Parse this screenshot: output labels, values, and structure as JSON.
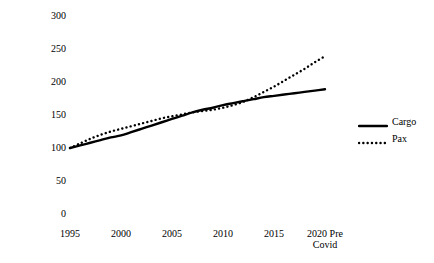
{
  "chart_data": {
    "type": "line",
    "title": "",
    "xlabel": "",
    "ylabel": "Index Number 1995 = 100",
    "xlim": [
      1995,
      2020
    ],
    "ylim": [
      0,
      300
    ],
    "yticks": [
      0,
      50,
      100,
      150,
      200,
      250,
      300
    ],
    "ytick_labels": [
      "0",
      "50",
      "100",
      "150",
      "200",
      "250",
      "300"
    ],
    "xticks": [
      1995,
      2000,
      2005,
      2010,
      2015,
      2020
    ],
    "xtick_labels": [
      "1995",
      "2000",
      "2005",
      "2010",
      "2015",
      "2020 Pre\nCovid"
    ],
    "grid": false,
    "legend_position": "right",
    "x": [
      1995,
      1996,
      1997,
      1998,
      1999,
      2000,
      2001,
      2002,
      2003,
      2004,
      2005,
      2006,
      2007,
      2008,
      2009,
      2010,
      2011,
      2012,
      2013,
      2014,
      2015,
      2016,
      2017,
      2018,
      2019,
      2020
    ],
    "series": [
      {
        "name": "Cargo",
        "style": "solid",
        "color": "#000000",
        "values": [
          100,
          104,
          108,
          112,
          116,
          119,
          124,
          129,
          134,
          139,
          144,
          149,
          154,
          158,
          161,
          165,
          168,
          171,
          174,
          177,
          179,
          181,
          183,
          185,
          187,
          189
        ]
      },
      {
        "name": "Pax",
        "style": "dotted",
        "color": "#000000",
        "values": [
          100,
          107,
          114,
          120,
          125,
          129,
          133,
          137,
          141,
          145,
          148,
          151,
          154,
          156,
          158,
          161,
          165,
          170,
          177,
          185,
          193,
          202,
          211,
          220,
          230,
          239
        ]
      }
    ]
  },
  "legend": {
    "items": [
      {
        "label": "Cargo",
        "style": "solid"
      },
      {
        "label": "Pax",
        "style": "dotted"
      }
    ]
  },
  "axes": {
    "y_title": "Index Number 1995 = 100"
  }
}
